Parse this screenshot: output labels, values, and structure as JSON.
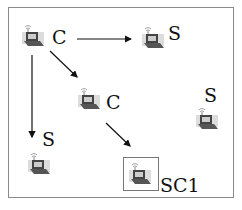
{
  "diagram": {
    "type": "network-topology",
    "nodes": [
      {
        "id": "n1",
        "label": "C",
        "icon": "wireless-laptop-icon"
      },
      {
        "id": "n2",
        "label": "S",
        "icon": "wireless-laptop-icon"
      },
      {
        "id": "n3",
        "label": "C",
        "icon": "wireless-laptop-icon"
      },
      {
        "id": "n4",
        "label": "S",
        "icon": "wireless-laptop-icon"
      },
      {
        "id": "n5",
        "label": "S",
        "icon": "wireless-laptop-icon"
      },
      {
        "id": "n6",
        "label": "SC1",
        "icon": "wireless-laptop-icon",
        "highlighted": true
      }
    ],
    "edges": [
      {
        "from": "n1",
        "to": "n2"
      },
      {
        "from": "n1",
        "to": "n3"
      },
      {
        "from": "n1",
        "to": "n5"
      },
      {
        "from": "n3",
        "to": "n6"
      }
    ],
    "colors": {
      "line": "#111111",
      "border": "#8a8a8a",
      "icon": "#555555"
    }
  }
}
